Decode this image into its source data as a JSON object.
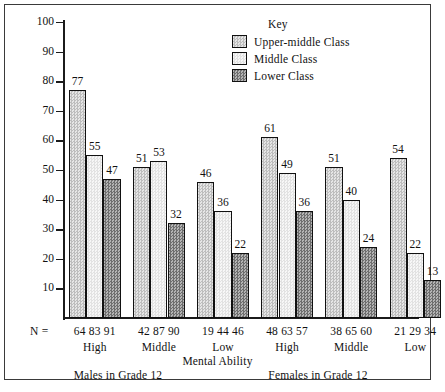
{
  "chart_data": {
    "type": "bar",
    "title": "",
    "xlabel": "Mental Ability",
    "ylabel": "Per cent Wanting to Graduate from University",
    "ylim": [
      0,
      100
    ],
    "yticks": [
      10,
      20,
      30,
      40,
      50,
      60,
      70,
      80,
      90,
      100
    ],
    "grid": false,
    "legend_position": "top-right",
    "legend_title": "Key",
    "categories": [
      "High",
      "Middle",
      "Low",
      "High",
      "Middle",
      "Low"
    ],
    "supercategories": [
      "Males in Grade 12",
      "Females in Grade 12"
    ],
    "series": [
      {
        "name": "Upper-middle Class",
        "values": [
          77,
          51,
          46,
          61,
          51,
          54
        ]
      },
      {
        "name": "Middle Class",
        "values": [
          55,
          53,
          36,
          49,
          40,
          22
        ]
      },
      {
        "name": "Lower Class",
        "values": [
          47,
          32,
          22,
          36,
          24,
          13
        ]
      }
    ],
    "n_label": "N =",
    "n_values": [
      [
        64,
        83,
        91
      ],
      [
        42,
        87,
        90
      ],
      [
        19,
        44,
        46
      ],
      [
        48,
        63,
        57
      ],
      [
        38,
        65,
        60
      ],
      [
        21,
        29,
        34
      ]
    ]
  }
}
